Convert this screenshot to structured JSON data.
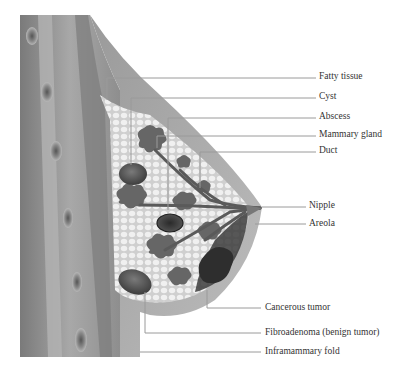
{
  "diagram": {
    "labels": [
      {
        "id": "fatty-tissue",
        "text": "Fatty tissue",
        "x": 319,
        "y": 69
      },
      {
        "id": "cyst",
        "text": "Cyst",
        "x": 319,
        "y": 87
      },
      {
        "id": "abscess",
        "text": "Abscess",
        "x": 319,
        "y": 108
      },
      {
        "id": "mammary-gland",
        "text": "Mammary gland",
        "x": 319,
        "y": 126
      },
      {
        "id": "duct",
        "text": "Duct",
        "x": 319,
        "y": 144
      },
      {
        "id": "nipple",
        "text": "Nipple",
        "x": 310,
        "y": 206
      },
      {
        "id": "areola",
        "text": "Areola",
        "x": 310,
        "y": 224
      },
      {
        "id": "cancerous-tumor",
        "text": "Cancerous tumor",
        "x": 265,
        "y": 302
      },
      {
        "id": "fibroadenoma",
        "text": "Fibroadenoma (benign tumor)",
        "x": 265,
        "y": 326
      },
      {
        "id": "inframammary-fold",
        "text": "Inframammary fold",
        "x": 265,
        "y": 346
      }
    ],
    "colors": {
      "skin_dark": "#8a8a8a",
      "skin_light": "#c8c8c8",
      "fat": "#e6e6e6",
      "gland": "#6e6e6e",
      "leader": "#999999",
      "text": "#333333"
    }
  }
}
